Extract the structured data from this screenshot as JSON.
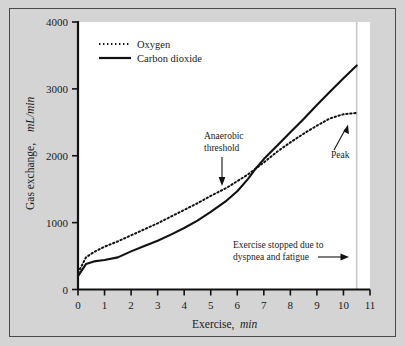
{
  "figure": {
    "background_color": "#d4d4d4",
    "plot_background_color": "#ffffff",
    "border_color": "#4a4a4a",
    "line_color": "#111111"
  },
  "chart_data": {
    "type": "line",
    "title": "",
    "xlabel_main": "Exercise,",
    "xlabel_units": "min",
    "ylabel_main": "Gas exchange,",
    "ylabel_units": "mL/min",
    "xlim": [
      0,
      11
    ],
    "ylim": [
      0,
      4000
    ],
    "grid": false,
    "x_ticks": [
      0,
      1,
      2,
      3,
      4,
      5,
      6,
      7,
      8,
      9,
      10,
      11
    ],
    "x_tick_labels": [
      "0",
      "1",
      "2",
      "3",
      "4",
      "5",
      "6",
      "7",
      "8",
      "9",
      "10",
      "11"
    ],
    "y_ticks": [
      0,
      1000,
      2000,
      3000,
      4000
    ],
    "y_tick_labels": [
      "0",
      "1000",
      "2000",
      "3000",
      "4000"
    ],
    "legend_position": "upper-left",
    "series": [
      {
        "name": "Oxygen",
        "style": "dotted",
        "color": "#111111",
        "x": [
          0,
          0.3,
          0.6,
          1.0,
          1.5,
          2.0,
          2.5,
          3.0,
          3.5,
          4.0,
          4.5,
          5.0,
          5.6,
          6.0,
          6.4,
          6.7,
          7.0,
          7.5,
          8.0,
          8.5,
          9.0,
          9.5,
          10.0,
          10.5
        ],
        "y": [
          250,
          480,
          560,
          640,
          720,
          810,
          900,
          990,
          1090,
          1190,
          1290,
          1400,
          1520,
          1620,
          1720,
          1810,
          1900,
          2060,
          2200,
          2330,
          2450,
          2560,
          2620,
          2640
        ]
      },
      {
        "name": "Carbon dioxide",
        "style": "solid",
        "color": "#111111",
        "x": [
          0,
          0.3,
          0.6,
          1.0,
          1.5,
          2.0,
          2.5,
          3.0,
          3.5,
          4.0,
          4.5,
          5.0,
          5.6,
          6.0,
          6.4,
          6.7,
          7.0,
          7.5,
          8.0,
          8.5,
          9.0,
          9.5,
          10.0,
          10.5
        ],
        "y": [
          200,
          380,
          420,
          440,
          480,
          570,
          650,
          730,
          820,
          920,
          1030,
          1160,
          1330,
          1470,
          1650,
          1810,
          1950,
          2150,
          2350,
          2550,
          2760,
          2960,
          3160,
          3350
        ]
      }
    ],
    "annotations": [
      {
        "name": "anaerobic-threshold",
        "line1": "Anaerobic",
        "line2": "threshold",
        "arrow": "down",
        "target_x": 5.6,
        "target_y": 1500
      },
      {
        "name": "peak",
        "line1": "Peak",
        "arrow": "up-right",
        "target_x": 10.2,
        "target_y": 2620
      },
      {
        "name": "exercise-stopped",
        "line1": "Exercise stopped due to",
        "line2": "dyspnea and fatigue",
        "arrow": "right",
        "target_x": 10.5,
        "target_y": 700
      }
    ],
    "marker_lines": [
      {
        "name": "exercise-stop-line",
        "orientation": "vertical",
        "x": 10.5,
        "color": "#c8c8c8"
      }
    ]
  }
}
